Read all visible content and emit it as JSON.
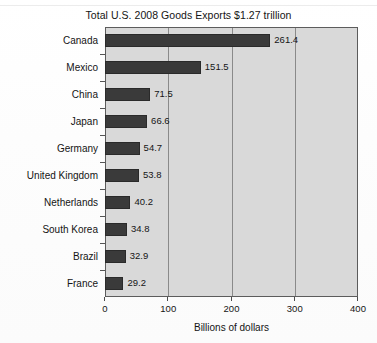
{
  "chart_data": {
    "type": "bar",
    "orientation": "horizontal",
    "title": "Total U.S. 2008 Goods Exports $1.27 trillion",
    "xlabel": "Billions of dollars",
    "ylabel": "",
    "xlim": [
      0,
      400
    ],
    "xticks": [
      "0",
      "100",
      "200",
      "300",
      "400"
    ],
    "xtick_values": [
      0,
      100,
      200,
      300,
      400
    ],
    "grid": "vertical gridlines at 100, 200, 300",
    "legend": "none",
    "categories": [
      "Canada",
      "Mexico",
      "China",
      "Japan",
      "Germany",
      "United Kingdom",
      "Netherlands",
      "South Korea",
      "Brazil",
      "France"
    ],
    "values": [
      261.4,
      151.5,
      71.5,
      66.6,
      54.7,
      53.8,
      40.2,
      34.8,
      32.9,
      29.2
    ],
    "value_labels": [
      "261.4",
      "151.5",
      "71.5",
      "66.6",
      "54.7",
      "53.8",
      "40.2",
      "34.8",
      "32.9",
      "29.2"
    ],
    "colors": {
      "bar": "#3a3a3a",
      "plot_background": "#d9d9d9",
      "page_background": "#ffffff",
      "gridline": "#8a8a8a",
      "axis": "#5c5c5c",
      "text": "#141414"
    }
  }
}
